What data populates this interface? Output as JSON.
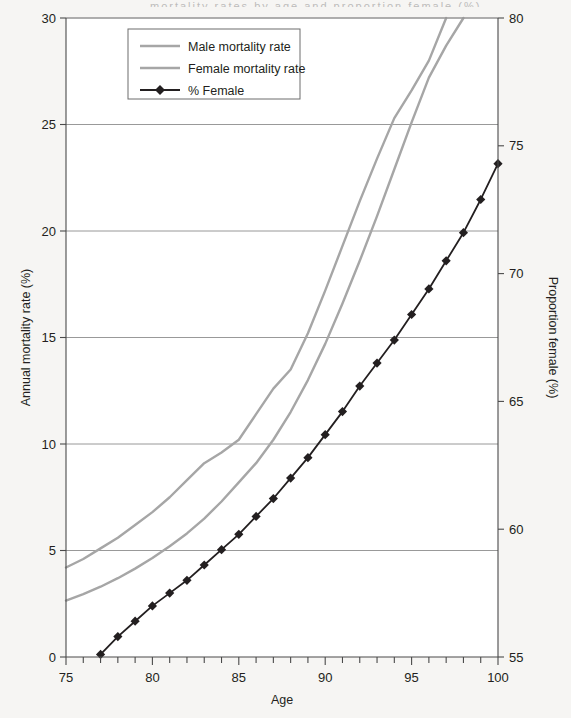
{
  "figure": {
    "background_color": "#f6f5f3",
    "plot_background": "#ffffff",
    "cropped_title_sliver": "mortality rates by age and proportion female (%)"
  },
  "chart_data": {
    "type": "line",
    "title": "",
    "xlabel": "Age",
    "ylabel": "Annual mortality rate (%)",
    "y2label": "Proportion female (%)",
    "xlim": [
      75,
      100
    ],
    "ylim": [
      0,
      30
    ],
    "y2lim": [
      55,
      80
    ],
    "xticks": [
      75,
      80,
      85,
      90,
      95,
      100
    ],
    "yticks": [
      0,
      5,
      10,
      15,
      20,
      25,
      30
    ],
    "y2ticks": [
      55,
      60,
      65,
      70,
      75,
      80
    ],
    "minor_xtick_interval": 1,
    "grid": "horizontal-only",
    "legend_position": "top-left-inside",
    "legend_border": true,
    "x": [
      75,
      76,
      77,
      78,
      79,
      80,
      81,
      82,
      83,
      84,
      85,
      86,
      87,
      88,
      89,
      90,
      91,
      92,
      93,
      94,
      95,
      96,
      97,
      98,
      99,
      100
    ],
    "series": [
      {
        "name": "Male mortality rate",
        "axis": "left",
        "color": "#a6a6a6",
        "style": "line",
        "marker": "none",
        "values": [
          4.2,
          4.6,
          5.1,
          5.6,
          6.2,
          6.8,
          7.5,
          8.3,
          9.1,
          9.6,
          10.2,
          11.4,
          12.6,
          13.5,
          15.2,
          17.2,
          19.3,
          21.4,
          23.4,
          25.3,
          26.6,
          28.0,
          30.0,
          null,
          null,
          null
        ]
      },
      {
        "name": "Female mortality rate",
        "axis": "left",
        "color": "#a6a6a6",
        "style": "line",
        "marker": "none",
        "values": [
          2.65,
          2.95,
          3.3,
          3.7,
          4.15,
          4.65,
          5.2,
          5.8,
          6.5,
          7.3,
          8.2,
          9.1,
          10.2,
          11.5,
          13.0,
          14.7,
          16.6,
          18.6,
          20.7,
          22.9,
          25.1,
          27.2,
          28.7,
          30.0,
          null,
          null
        ]
      },
      {
        "name": "% Female",
        "axis": "right",
        "color": "#231f20",
        "style": "line-marker",
        "marker": "diamond",
        "values": [
          null,
          null,
          55.1,
          55.8,
          56.4,
          57.0,
          57.5,
          58.0,
          58.6,
          59.2,
          59.8,
          60.5,
          61.2,
          62.0,
          62.8,
          63.7,
          64.6,
          65.6,
          66.5,
          67.4,
          68.4,
          69.4,
          70.5,
          71.6,
          72.9,
          74.3
        ]
      }
    ],
    "legend": [
      {
        "label": "Male mortality rate",
        "color": "#a6a6a6",
        "marker": "none"
      },
      {
        "label": "Female mortality rate",
        "color": "#a6a6a6",
        "marker": "none"
      },
      {
        "label": "% Female",
        "color": "#231f20",
        "marker": "diamond"
      }
    ]
  }
}
